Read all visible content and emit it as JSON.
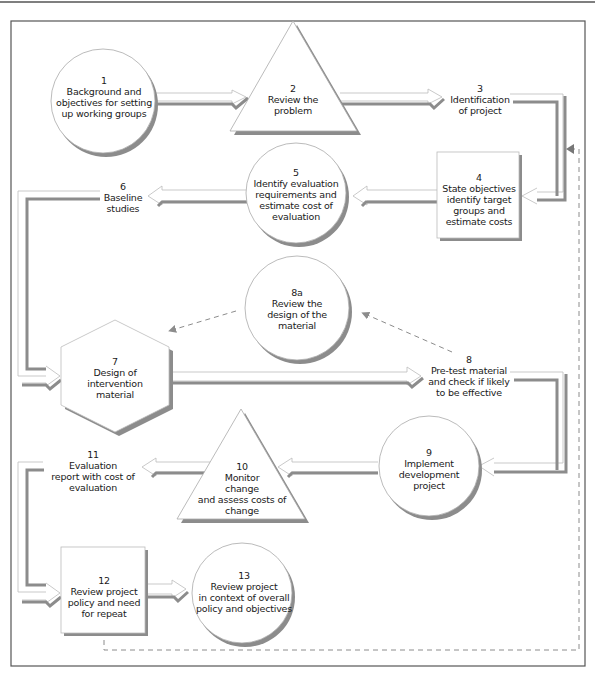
{
  "diagram": {
    "type": "flowchart",
    "nodes": [
      {
        "id": "1",
        "shape": "circle",
        "number": "1",
        "label": "Background and\nobjectives for setting\nup working groups"
      },
      {
        "id": "2",
        "shape": "triangle",
        "number": "2",
        "label": "Review the\nproblem"
      },
      {
        "id": "3",
        "shape": "text",
        "number": "3",
        "label": "Identification\nof project"
      },
      {
        "id": "4",
        "shape": "box",
        "number": "4",
        "label": "State objectives\nidentify target\ngroups and\nestimate costs"
      },
      {
        "id": "5",
        "shape": "circle",
        "number": "5",
        "label": "Identify evaluation\nrequirements and\nestimate cost of\nevaluation"
      },
      {
        "id": "6",
        "shape": "text",
        "number": "6",
        "label": "Baseline\nstudies"
      },
      {
        "id": "7",
        "shape": "hexagon",
        "number": "7",
        "label": "Design of\nintervention\nmaterial"
      },
      {
        "id": "8a",
        "shape": "circle",
        "number": "8a",
        "label": "Review the\ndesign of the\nmaterial"
      },
      {
        "id": "8",
        "shape": "text",
        "number": "8",
        "label": "Pre-test material\nand check if likely\nto be effective"
      },
      {
        "id": "9",
        "shape": "circle",
        "number": "9",
        "label": "Implement\ndevelopment\nproject"
      },
      {
        "id": "10",
        "shape": "triangle",
        "number": "10",
        "label": "Monitor\nchange\nand assess costs of\nchange"
      },
      {
        "id": "11",
        "shape": "text",
        "number": "11",
        "label": "Evaluation\nreport with cost of\nevaluation"
      },
      {
        "id": "12",
        "shape": "box",
        "number": "12",
        "label": "Review project\npolicy and need\nfor repeat"
      },
      {
        "id": "13",
        "shape": "circle",
        "number": "13",
        "label": "Review project\nin context of overall\npolicy and objectives"
      }
    ],
    "edges": [
      {
        "from": "1",
        "to": "2",
        "style": "solid-arrow"
      },
      {
        "from": "2",
        "to": "3",
        "style": "solid-arrow"
      },
      {
        "from": "3",
        "to": "4",
        "style": "solid-arrow"
      },
      {
        "from": "4",
        "to": "5",
        "style": "solid-arrow"
      },
      {
        "from": "5",
        "to": "6",
        "style": "solid-arrow"
      },
      {
        "from": "6",
        "to": "7",
        "style": "solid-arrow"
      },
      {
        "from": "7",
        "to": "8",
        "style": "solid-arrow"
      },
      {
        "from": "8",
        "to": "8a",
        "style": "dashed"
      },
      {
        "from": "8a",
        "to": "7",
        "style": "dashed"
      },
      {
        "from": "8",
        "to": "9",
        "style": "solid-arrow"
      },
      {
        "from": "9",
        "to": "10",
        "style": "solid-arrow"
      },
      {
        "from": "10",
        "to": "11",
        "style": "solid-arrow"
      },
      {
        "from": "11",
        "to": "12",
        "style": "solid-arrow"
      },
      {
        "from": "12",
        "to": "13",
        "style": "solid-arrow"
      },
      {
        "from": "12",
        "to": "4",
        "style": "dashed"
      }
    ],
    "colors": {
      "stroke": "#9a9a9a",
      "shadow": "#8c8c8c",
      "fill": "#ffffff",
      "frame": "#555555",
      "text": "#1a1a1a"
    }
  }
}
